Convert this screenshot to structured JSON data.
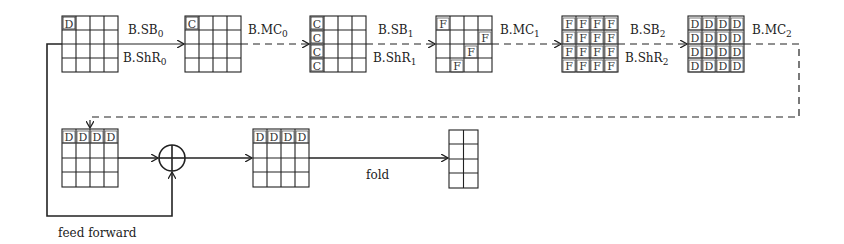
{
  "diagram": {
    "top_row": {
      "states": [
        {
          "id": "s0",
          "marks": [
            [
              0,
              0,
              "D"
            ]
          ]
        },
        {
          "id": "s1",
          "marks": [
            [
              0,
              0,
              "C"
            ]
          ]
        },
        {
          "id": "s2",
          "marks": [
            [
              0,
              0,
              "C"
            ],
            [
              1,
              0,
              "C"
            ],
            [
              2,
              0,
              "C"
            ],
            [
              3,
              0,
              "C"
            ]
          ]
        },
        {
          "id": "s3",
          "marks": [
            [
              0,
              0,
              "F"
            ],
            [
              1,
              3,
              "F"
            ],
            [
              2,
              2,
              "F"
            ],
            [
              3,
              1,
              "F"
            ]
          ]
        },
        {
          "id": "s4",
          "fill": "F"
        },
        {
          "id": "s5",
          "fill": "D"
        }
      ],
      "edges": [
        {
          "above": "B.SB",
          "above_sub": "0",
          "below": "B.ShR",
          "below_sub": "0",
          "style": "solid"
        },
        {
          "above": "B.MC",
          "above_sub": "0",
          "below": "",
          "below_sub": "",
          "style": "dashed"
        },
        {
          "above": "B.SB",
          "above_sub": "1",
          "below": "B.ShR",
          "below_sub": "1",
          "style": "dashed"
        },
        {
          "above": "B.MC",
          "above_sub": "1",
          "below": "",
          "below_sub": "",
          "style": "dashed"
        },
        {
          "above": "B.SB",
          "above_sub": "2",
          "below": "B.ShR",
          "below_sub": "2",
          "style": "dashed"
        },
        {
          "above": "B.MC",
          "above_sub": "2",
          "below": "",
          "below_sub": "",
          "style": "dashed"
        }
      ]
    },
    "bottom_row": {
      "state_in": {
        "row0": "DDDD"
      },
      "xor_symbol": "⊕",
      "state_out": {
        "row0": "DDDD"
      },
      "fold_label": "fold",
      "final_state": {
        "cols": 2,
        "rows": 4
      }
    },
    "feed_forward_label": "feed forward",
    "letter": {
      "D": "D",
      "C": "C",
      "F": "F"
    }
  }
}
